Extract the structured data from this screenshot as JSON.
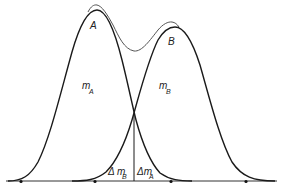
{
  "figure": {
    "labels": {
      "peak_a": "A",
      "peak_b": "B",
      "mass_a_main": "m",
      "mass_a_sub": "A",
      "mass_b_main": "m",
      "mass_b_sub": "B",
      "delta_mb_main": "Δ m",
      "delta_mb_sub": "B",
      "delta_ma_main": "Δm",
      "delta_ma_sub": "A"
    },
    "colors": {
      "curve": "#1a1a1a",
      "envelope": "#555555",
      "baseline": "#333333"
    },
    "baseline_markers": 4
  }
}
